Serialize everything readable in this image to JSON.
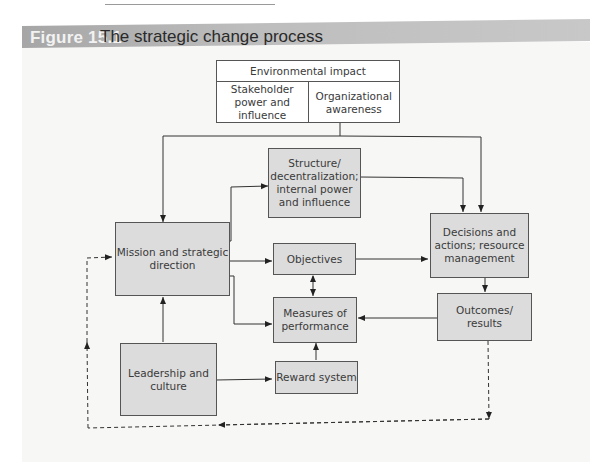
{
  "page": {
    "header_fragment": "ISP · STRA..."
  },
  "figure": {
    "label": "Figure 15.1",
    "title": "The strategic change process"
  },
  "nodes": {
    "environmental_impact": "Environmental impact",
    "stakeholder_power": "Stakeholder power and influence",
    "organizational_awareness": "Organizational awareness",
    "structure": "Structure/ decentralization; internal power and influence",
    "mission": "Mission and strategic direction",
    "objectives": "Objectives",
    "decisions": "Decisions and actions; resource management",
    "measures": "Measures of performance",
    "outcomes": "Outcomes/ results",
    "leadership": "Leadership and culture",
    "reward": "Reward system"
  },
  "edges": [
    {
      "from": "environmental_impact",
      "to": "mission",
      "style": "solid"
    },
    {
      "from": "environmental_impact",
      "to": "decisions",
      "style": "solid"
    },
    {
      "from": "mission",
      "to": "structure",
      "style": "solid"
    },
    {
      "from": "structure",
      "to": "decisions",
      "style": "solid"
    },
    {
      "from": "mission",
      "to": "objectives",
      "style": "solid"
    },
    {
      "from": "mission",
      "to": "measures",
      "style": "solid"
    },
    {
      "from": "objectives",
      "to": "decisions",
      "style": "solid"
    },
    {
      "from": "objectives",
      "to": "measures",
      "style": "solid",
      "bidirectional": true
    },
    {
      "from": "decisions",
      "to": "outcomes",
      "style": "solid"
    },
    {
      "from": "outcomes",
      "to": "measures",
      "style": "solid"
    },
    {
      "from": "reward",
      "to": "measures",
      "style": "solid"
    },
    {
      "from": "leadership",
      "to": "reward",
      "style": "solid"
    },
    {
      "from": "leadership",
      "to": "mission",
      "style": "solid"
    },
    {
      "from": "outcomes",
      "to": "mission",
      "style": "dashed",
      "note": "feedback loop"
    }
  ],
  "colors": {
    "box_fill": "#dcdcdc",
    "header_band": "#b3b3b3",
    "line": "#333333"
  }
}
